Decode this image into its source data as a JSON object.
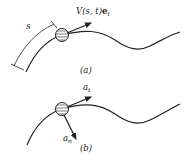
{
  "figure_a": {
    "label": "(a)",
    "velocity_label_prefix": "V(s, t)",
    "velocity_label_vector": "e",
    "velocity_label_subscript": "t",
    "arc_length_label": "s"
  },
  "figure_b": {
    "label": "(b)",
    "tangential_label": "a",
    "tangential_subscript": "t",
    "normal_label": "a",
    "normal_subscript": "n"
  },
  "colors": {
    "stroke": "#222222",
    "background": "#ffffff"
  }
}
